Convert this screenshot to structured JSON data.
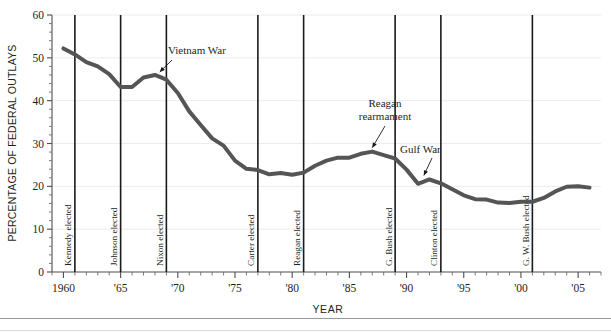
{
  "chart_data": {
    "type": "line",
    "title": "",
    "xlabel": "YEAR",
    "ylabel": "PERCENTAGE OF FEDERAL OUTLAYS",
    "xlim": [
      1959,
      2007
    ],
    "ylim": [
      0,
      60
    ],
    "ytick_step": 10,
    "yminor_step": 2,
    "xminor_step": 1,
    "grid": "horizontal-major-faint",
    "legend": "none",
    "line_color": "#555555",
    "line_width": 4,
    "xticks": [
      {
        "value": 1960,
        "label": "1960"
      },
      {
        "value": 1965,
        "label": "'65"
      },
      {
        "value": 1970,
        "label": "'70"
      },
      {
        "value": 1975,
        "label": "'75"
      },
      {
        "value": 1980,
        "label": "'80"
      },
      {
        "value": 1985,
        "label": "'85"
      },
      {
        "value": 1990,
        "label": "'90"
      },
      {
        "value": 1995,
        "label": "'95"
      },
      {
        "value": 2000,
        "label": "'00"
      },
      {
        "value": 2005,
        "label": "'05"
      }
    ],
    "yticks": [
      {
        "value": 0,
        "label": "0"
      },
      {
        "value": 10,
        "label": "10"
      },
      {
        "value": 20,
        "label": "20"
      },
      {
        "value": 30,
        "label": "30"
      },
      {
        "value": 40,
        "label": "40"
      },
      {
        "value": 50,
        "label": "50"
      },
      {
        "value": 60,
        "label": "60"
      }
    ],
    "x": [
      1960,
      1961,
      1962,
      1963,
      1964,
      1965,
      1966,
      1967,
      1968,
      1969,
      1970,
      1971,
      1972,
      1973,
      1974,
      1975,
      1976,
      1977,
      1978,
      1979,
      1980,
      1981,
      1982,
      1983,
      1984,
      1985,
      1986,
      1987,
      1988,
      1989,
      1990,
      1991,
      1992,
      1993,
      1994,
      1995,
      1996,
      1997,
      1998,
      1999,
      2000,
      2001,
      2002,
      2003,
      2004,
      2005,
      2006
    ],
    "values": [
      52.2,
      50.8,
      49.0,
      48.0,
      46.2,
      43.2,
      43.2,
      45.4,
      46.0,
      44.9,
      41.8,
      37.5,
      34.3,
      31.2,
      29.5,
      26.0,
      24.1,
      23.8,
      22.8,
      23.1,
      22.7,
      23.2,
      24.8,
      26.0,
      26.7,
      26.7,
      27.6,
      28.1,
      27.3,
      26.5,
      23.9,
      20.6,
      21.6,
      20.7,
      19.3,
      17.9,
      17.0,
      16.9,
      16.2,
      16.1,
      16.4,
      16.4,
      17.3,
      18.8,
      19.9,
      20.0,
      19.7
    ],
    "series_label": "Defense share of federal outlays",
    "events": [
      {
        "year": 1961,
        "label": "Kennedy elected"
      },
      {
        "year": 1965,
        "label": "Johnson elected"
      },
      {
        "year": 1969,
        "label": "Nixon elected"
      },
      {
        "year": 1977,
        "label": "Carter elected"
      },
      {
        "year": 1981,
        "label": "Reagan elected"
      },
      {
        "year": 1989,
        "label": "G. Bush elected"
      },
      {
        "year": 1993,
        "label": "Clinton elected"
      },
      {
        "year": 2001,
        "label": "G. W. Bush elected"
      }
    ],
    "annotations": [
      {
        "label": "Vietnam War",
        "target_year": 1968.2,
        "target_value": 46.0
      },
      {
        "label": "Reagan rearmament",
        "label_line_1": "Reagan",
        "label_line_2": "rearmament",
        "target_year": 1987,
        "target_value": 28.1
      },
      {
        "label": "Gulf War",
        "target_year": 1991.6,
        "target_value": 21.6
      }
    ]
  }
}
